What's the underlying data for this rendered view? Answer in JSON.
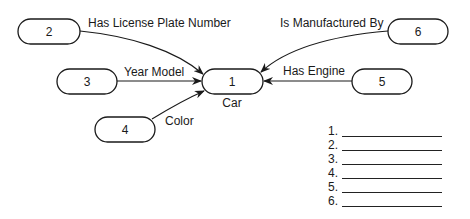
{
  "diagram": {
    "center": {
      "id": "1",
      "label": "1",
      "caption": "Car"
    },
    "nodes": [
      {
        "id": "2",
        "label": "2"
      },
      {
        "id": "3",
        "label": "3"
      },
      {
        "id": "4",
        "label": "4"
      },
      {
        "id": "5",
        "label": "5"
      },
      {
        "id": "6",
        "label": "6"
      }
    ],
    "edges": [
      {
        "from": "2",
        "to": "1",
        "label": "Has License Plate Number"
      },
      {
        "from": "3",
        "to": "1",
        "label": "Year Model"
      },
      {
        "from": "4",
        "to": "1",
        "label": "Color"
      },
      {
        "from": "5",
        "to": "1",
        "label": "Has Engine"
      },
      {
        "from": "6",
        "to": "1",
        "label": "Is Manufactured By"
      }
    ]
  },
  "answer_list": {
    "items": [
      "1.",
      "2.",
      "3.",
      "4.",
      "5.",
      "6."
    ]
  },
  "colors": {
    "stroke": "#1a1a1a",
    "background": "#ffffff"
  }
}
